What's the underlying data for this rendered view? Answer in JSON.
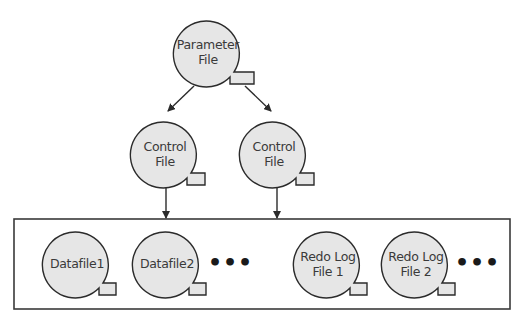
{
  "diagram": {
    "colors": {
      "node_fill": "#e6e6e6",
      "stroke": "#2b2b2b",
      "background": "#ffffff"
    },
    "nodes": {
      "parameter_file": {
        "line1": "Parameter",
        "line2": "File"
      },
      "control_file_1": {
        "line1": "Control",
        "line2": "File"
      },
      "control_file_2": {
        "line1": "Control",
        "line2": "File"
      },
      "datafile_1": {
        "line1": "Datafile1"
      },
      "datafile_2": {
        "line1": "Datafile2"
      },
      "redo_log_1": {
        "line1": "Redo Log",
        "line2": "File 1"
      },
      "redo_log_2": {
        "line1": "Redo Log",
        "line2": "File 2"
      }
    },
    "ellipsis": "•••",
    "edges": [
      {
        "from": "parameter_file",
        "to": "control_file_1"
      },
      {
        "from": "parameter_file",
        "to": "control_file_2"
      },
      {
        "from": "control_file_1",
        "to": "datafiles_group"
      },
      {
        "from": "control_file_2",
        "to": "datafiles_group"
      }
    ]
  }
}
